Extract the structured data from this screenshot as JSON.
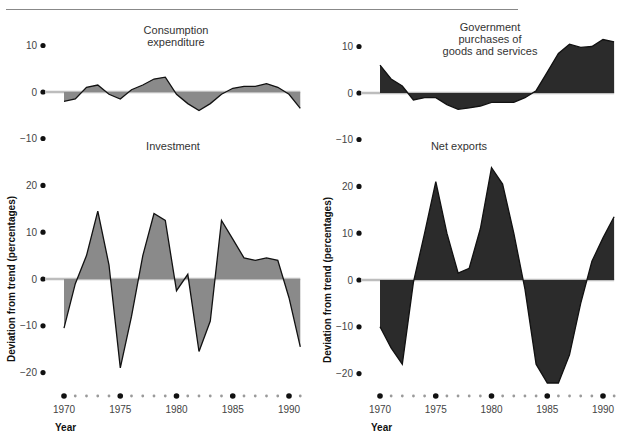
{
  "chart_data": [
    {
      "id": "consumption",
      "type": "area",
      "title": "Consumption expenditure",
      "title_lines": [
        "Consumption",
        "expenditure"
      ],
      "ylabel": "",
      "yticks": [
        10,
        0,
        -10
      ],
      "ylim": [
        -10,
        10
      ],
      "fill": "#8a8a8a",
      "x": [
        1970,
        1971,
        1972,
        1973,
        1974,
        1975,
        1976,
        1977,
        1978,
        1979,
        1980,
        1981,
        1982,
        1983,
        1984,
        1985,
        1986,
        1987,
        1988,
        1989,
        1990,
        1991
      ],
      "values": [
        -2,
        -1.5,
        1,
        1.5,
        -0.5,
        -1.5,
        0.5,
        1.5,
        2.8,
        3.2,
        -0.5,
        -2.5,
        -4,
        -2.5,
        -0.5,
        0.8,
        1.2,
        1.2,
        1.8,
        1,
        -0.5,
        -3.5
      ]
    },
    {
      "id": "government",
      "type": "area",
      "title": "Government purchases of goods and services",
      "title_lines": [
        "Government",
        "purchases of",
        "goods and services"
      ],
      "ylabel": "",
      "yticks": [
        10,
        0,
        -10
      ],
      "ylim": [
        -10,
        10
      ],
      "fill": "#2b2b2b",
      "x": [
        1970,
        1971,
        1972,
        1973,
        1974,
        1975,
        1976,
        1977,
        1978,
        1979,
        1980,
        1981,
        1982,
        1983,
        1984,
        1985,
        1986,
        1987,
        1988,
        1989,
        1990,
        1991
      ],
      "values": [
        6,
        3,
        1.5,
        -1.5,
        -1,
        -1,
        -2.5,
        -3.5,
        -3.2,
        -2.8,
        -2,
        -2,
        -2,
        -1,
        0.5,
        4.5,
        8.5,
        10.5,
        9.8,
        10,
        11.5,
        11
      ]
    },
    {
      "id": "investment",
      "type": "area",
      "title": "Investment",
      "title_lines": [
        "Investment"
      ],
      "ylabel": "Deviation from trend (percentages)",
      "xlabel": "Year",
      "yticks": [
        20,
        10,
        0,
        -10,
        -20
      ],
      "ylim": [
        -20,
        20
      ],
      "fill": "#8a8a8a",
      "x": [
        1970,
        1971,
        1972,
        1973,
        1974,
        1975,
        1976,
        1977,
        1978,
        1979,
        1980,
        1981,
        1982,
        1983,
        1984,
        1985,
        1986,
        1987,
        1988,
        1989,
        1990,
        1991
      ],
      "values": [
        -10.5,
        -1,
        5,
        14.5,
        3,
        -19,
        -8,
        5,
        14,
        12.5,
        -2.5,
        1,
        -15.5,
        -9,
        12.5,
        8.5,
        4.5,
        4,
        4.5,
        4,
        -4,
        -14.5
      ]
    },
    {
      "id": "net-exports",
      "type": "area",
      "title": "Net exports",
      "title_lines": [
        "Net exports"
      ],
      "ylabel": "Deviation from trend (percentages)",
      "xlabel": "Year",
      "yticks": [
        20,
        10,
        0,
        -10,
        -20
      ],
      "ylim": [
        -20,
        20
      ],
      "fill": "#2b2b2b",
      "x": [
        1970,
        1971,
        1972,
        1973,
        1974,
        1975,
        1976,
        1977,
        1978,
        1979,
        1980,
        1981,
        1982,
        1983,
        1984,
        1985,
        1986,
        1987,
        1988,
        1989,
        1990,
        1991
      ],
      "values": [
        -10,
        -14.5,
        -18,
        -0.5,
        10,
        21,
        10,
        1.5,
        2.5,
        11,
        24,
        20.5,
        10,
        -2,
        -18,
        -22,
        -22,
        -16,
        -5,
        4,
        9,
        13.5
      ]
    }
  ],
  "axis": {
    "year_ticks": [
      "1970",
      "1975",
      "1980",
      "1985",
      "1990"
    ],
    "xlabel": "Year",
    "ylabel": "Deviation from trend (percentages)"
  },
  "colors": {
    "zero_line": "#bdbdbd",
    "light_fill": "#8a8a8a",
    "dark_fill": "#2b2b2b",
    "major_dot": "#111111",
    "minor_dot": "#9a9a9a"
  }
}
